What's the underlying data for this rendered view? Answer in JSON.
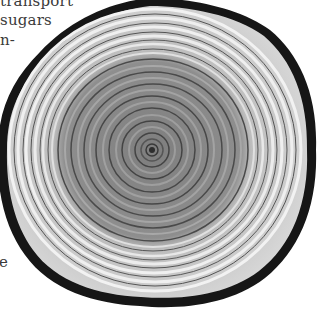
{
  "text_fragments": {
    "line1": "transport",
    "line2": "sugars",
    "line3": "n-",
    "line4": "e"
  },
  "illustration": {
    "subject": "tree-trunk-cross-section",
    "center": [
      152,
      150
    ],
    "colors": {
      "bark": "#1a1a1a",
      "sapwood": "#c8c8c8",
      "sapwood_band": "#efefef",
      "heartwood": "#8e8e8e",
      "ring_line": "#4a4a4a",
      "pith": "#2e2e2e"
    }
  }
}
